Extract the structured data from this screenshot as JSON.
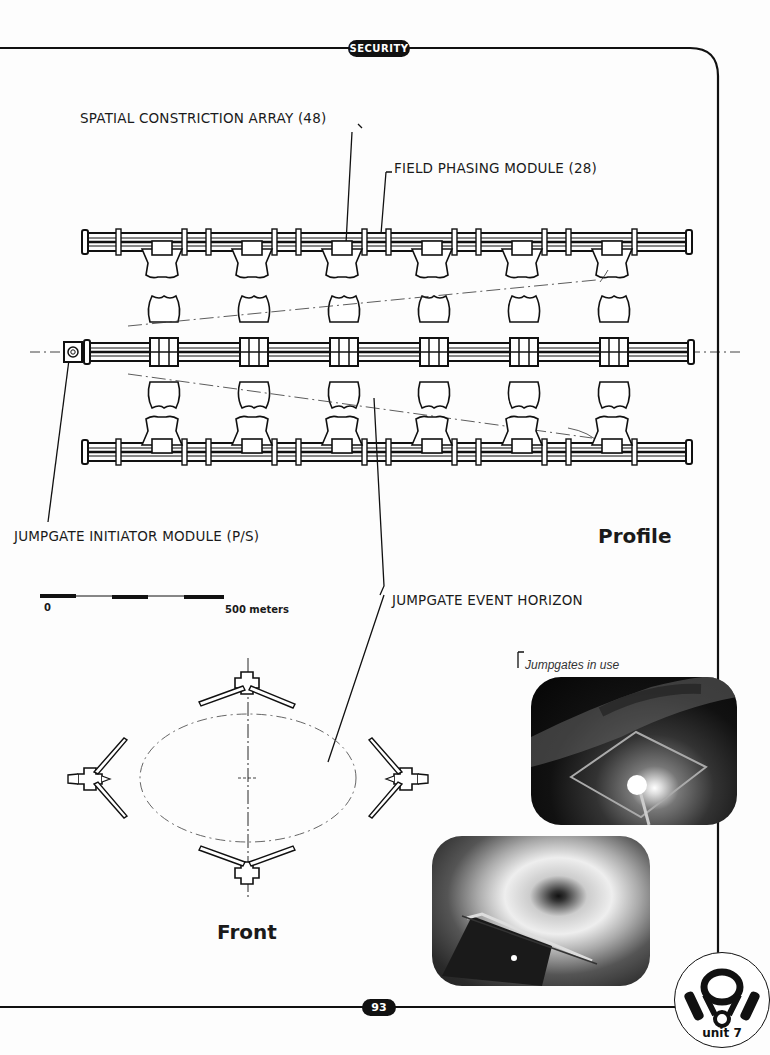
{
  "header": {
    "section_badge": "SECURITY"
  },
  "labels": {
    "spatial_array": "SPATIAL CONSTRICTION ARRAY (48)",
    "field_phasing": "FIELD PHASING MODULE (28)",
    "initiator": "JUMPGATE INITIATOR MODULE (P/S)",
    "event_horizon": "JUMPGATE EVENT HORIZON"
  },
  "views": {
    "profile": "Profile",
    "front": "Front"
  },
  "scale": {
    "start": "0",
    "end": "500  meters"
  },
  "photos": {
    "caption": "Jumpgates in use"
  },
  "footer": {
    "page_number": "93",
    "unit_badge": "unit 7"
  }
}
